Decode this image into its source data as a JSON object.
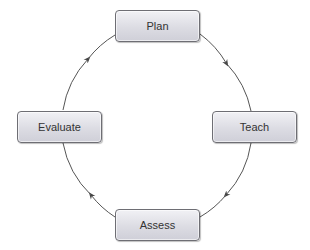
{
  "diagram": {
    "type": "cycle",
    "nodes": [
      {
        "id": "plan",
        "label": "Plan"
      },
      {
        "id": "teach",
        "label": "Teach"
      },
      {
        "id": "assess",
        "label": "Assess"
      },
      {
        "id": "evaluate",
        "label": "Evaluate"
      }
    ],
    "edges": [
      {
        "from": "plan",
        "to": "teach"
      },
      {
        "from": "teach",
        "to": "assess"
      },
      {
        "from": "assess",
        "to": "evaluate"
      },
      {
        "from": "evaluate",
        "to": "plan"
      }
    ],
    "direction": "clockwise",
    "colors": {
      "line": "#555555",
      "box_border": "#6e6e74",
      "box_fill": "#dcdce3",
      "text": "#333333"
    }
  }
}
